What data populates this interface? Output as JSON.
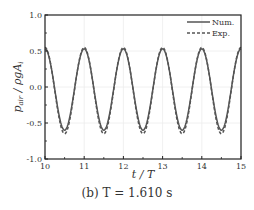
{
  "chart_data": {
    "type": "line",
    "title": "",
    "xlabel": "t / T",
    "ylabel": "p_air / ρgA_i",
    "xlim": [
      10,
      15
    ],
    "ylim": [
      -1.0,
      1.0
    ],
    "xticks": [
      "10",
      "11",
      "12",
      "13",
      "14",
      "15"
    ],
    "yticks": [
      "1.0",
      "0.5",
      "0.0",
      "-0.5",
      "-1.0"
    ],
    "grid": true,
    "legend_position": "upper right",
    "series": [
      {
        "name": "Num.",
        "style": "solid",
        "color": "#555555",
        "period": 1.0,
        "peak": 0.53,
        "trough": -0.6,
        "peak_times": [
          11,
          12,
          13,
          14,
          15
        ],
        "trough_times": [
          10.5,
          11.5,
          12.5,
          13.5,
          14.5
        ],
        "x": [
          10.0,
          10.25,
          10.5,
          10.75,
          11.0,
          11.25,
          11.5,
          11.75,
          12.0,
          12.25,
          12.5,
          12.75,
          13.0,
          13.25,
          13.5,
          13.75,
          14.0,
          14.25,
          14.5,
          14.75,
          15.0
        ],
        "values": [
          0.5,
          -0.05,
          -0.6,
          -0.05,
          0.53,
          -0.05,
          -0.6,
          -0.05,
          0.53,
          -0.05,
          -0.6,
          -0.05,
          0.53,
          -0.05,
          -0.6,
          -0.05,
          0.53,
          -0.05,
          -0.6,
          -0.05,
          0.53
        ]
      },
      {
        "name": "Exp.",
        "style": "dashed",
        "color": "#555555",
        "period": 1.0,
        "peak": 0.55,
        "trough": -0.65,
        "peak_times": [
          11,
          12,
          13,
          14,
          15
        ],
        "trough_times": [
          10.5,
          11.5,
          12.5,
          13.5,
          14.5
        ],
        "x": [
          10.0,
          10.25,
          10.5,
          10.75,
          11.0,
          11.25,
          11.5,
          11.75,
          12.0,
          12.25,
          12.5,
          12.75,
          13.0,
          13.25,
          13.5,
          13.75,
          14.0,
          14.25,
          14.5,
          14.75,
          15.0
        ],
        "values": [
          0.52,
          -0.05,
          -0.65,
          -0.05,
          0.55,
          -0.05,
          -0.65,
          -0.05,
          0.55,
          -0.05,
          -0.65,
          -0.05,
          0.55,
          -0.05,
          -0.65,
          -0.05,
          0.55,
          -0.05,
          -0.65,
          -0.05,
          0.55
        ]
      }
    ]
  },
  "labels": {
    "ylabel_main": "p",
    "ylabel_sub": "air",
    "ylabel_rest": " / ρgA",
    "ylabel_sub2": "i",
    "xlabel": "t / T",
    "legend_num": "Num.",
    "legend_exp": "Exp."
  },
  "caption": "(b)  T = 1.610 s"
}
